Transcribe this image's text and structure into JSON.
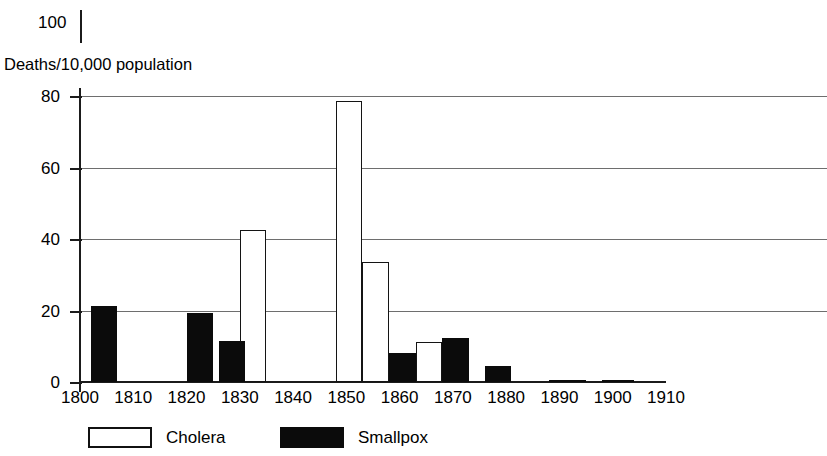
{
  "chart_data": {
    "type": "bar",
    "title": "",
    "subtitle": "",
    "xlabel": "",
    "ylabel": "Deaths/10,000 population",
    "ylim": [
      0,
      100
    ],
    "xlim": [
      1800,
      1910
    ],
    "y_ticks": [
      0,
      20,
      40,
      60,
      80,
      100
    ],
    "y_gridlines": [
      20,
      40,
      60,
      80
    ],
    "x_ticks": [
      1800,
      1810,
      1820,
      1830,
      1840,
      1850,
      1860,
      1870,
      1880,
      1890,
      1900,
      1910
    ],
    "grid": "horizontal",
    "legend_position": "bottom-left",
    "series": [
      {
        "name": "Cholera",
        "color": "#ffffff",
        "edge_color": "#141414",
        "bars": [
          {
            "x_start": 1830,
            "x_end": 1835,
            "value": 42.5
          },
          {
            "x_start": 1848,
            "x_end": 1853,
            "value": 78.5
          },
          {
            "x_start": 1853,
            "x_end": 1858,
            "value": 33.5
          },
          {
            "x_start": 1863,
            "x_end": 1868,
            "value": 11.3
          }
        ]
      },
      {
        "name": "Smallpox",
        "color": "#0b0b0b",
        "edge_color": "#0b0b0b",
        "bars": [
          {
            "x_start": 1802,
            "x_end": 1807,
            "value": 21.3
          },
          {
            "x_start": 1820,
            "x_end": 1825,
            "value": 19.2
          },
          {
            "x_start": 1826,
            "x_end": 1831,
            "value": 11.4
          },
          {
            "x_start": 1858,
            "x_end": 1863,
            "value": 8.2
          },
          {
            "x_start": 1868,
            "x_end": 1873,
            "value": 12.4
          },
          {
            "x_start": 1876,
            "x_end": 1881,
            "value": 4.5
          },
          {
            "x_start": 1888,
            "x_end": 1895,
            "value": 0.6
          },
          {
            "x_start": 1898,
            "x_end": 1904,
            "value": 0.6
          }
        ]
      }
    ]
  },
  "axis": {
    "top_tick_label": "100",
    "caption": "Deaths/10,000 population",
    "y_tick_labels": [
      "80",
      "60",
      "40",
      "20",
      "0"
    ],
    "x_tick_labels": [
      "1800",
      "1810",
      "1820",
      "1830",
      "1840",
      "1850",
      "1860",
      "1870",
      "1880",
      "1890",
      "1900",
      "1910"
    ]
  },
  "legend": {
    "entries": [
      {
        "label": "Cholera",
        "style": "cholera"
      },
      {
        "label": "Smallpox",
        "style": "smallpox"
      }
    ]
  }
}
